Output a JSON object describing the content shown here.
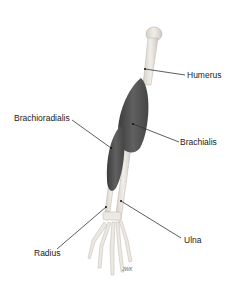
{
  "diagram": {
    "labels": {
      "humerus": "Humerus",
      "brachioradialis": "Brachioradialis",
      "brachialis": "Brachialis",
      "radius": "Radius",
      "ulna": "Ulna"
    },
    "signature": "JWK",
    "colors": {
      "background": "#ffffff",
      "bone": "#e6e2dc",
      "bone_outline": "#b8b2aa",
      "muscle": "#555555",
      "muscle_dark": "#3a3a3a",
      "leader_line": "#333333",
      "text": "#222222"
    }
  }
}
